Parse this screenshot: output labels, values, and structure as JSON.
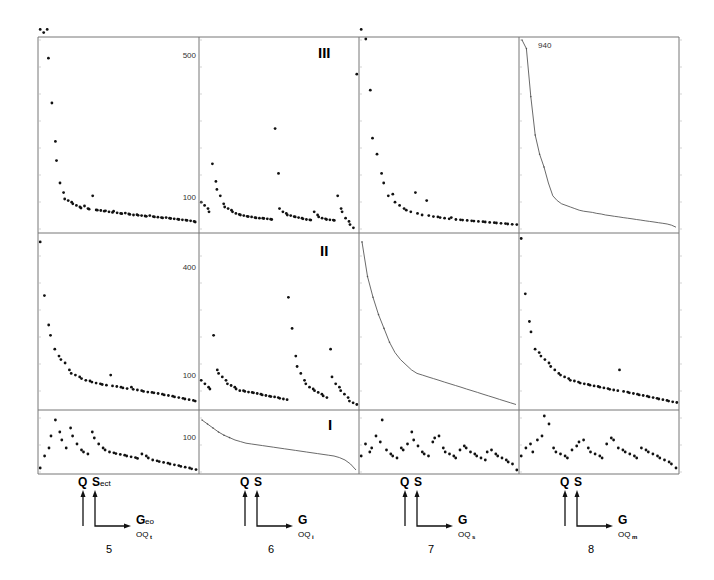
{
  "chart_data": {
    "type": "scatter",
    "title": "",
    "row_labels": [
      "III",
      "II",
      "I"
    ],
    "column_labels": [
      "5",
      "6",
      "7",
      "8"
    ],
    "y_tick_labels": {
      "row_III": [
        "500",
        "100"
      ],
      "row_II": [
        "400",
        "100"
      ],
      "row_I": [
        "100"
      ]
    },
    "annotation": "940",
    "axis_legends": [
      {
        "col": "5",
        "q": "Q",
        "s": "S",
        "s_sub": "ect",
        "g": "G",
        "g_sub": "eo",
        "oq": "OQ",
        "oq_sub": "t"
      },
      {
        "col": "6",
        "q": "Q",
        "s": "S",
        "s_sub": "",
        "g": "G",
        "g_sub": "",
        "oq": "OQ",
        "oq_sub": "i"
      },
      {
        "col": "7",
        "q": "Q",
        "s": "S",
        "s_sub": "",
        "g": "G",
        "g_sub": "",
        "oq": "OQ",
        "oq_sub": "s"
      },
      {
        "col": "8",
        "q": "Q",
        "s": "S",
        "s_sub": "",
        "g": "G",
        "g_sub": "",
        "oq": "OQ",
        "oq_sub": "m"
      }
    ],
    "panels": [
      {
        "row": "III",
        "col": "5",
        "style": "dots",
        "ylim": [
          0,
          600
        ],
        "values": [
          640,
          620,
          650,
          540,
          400,
          280,
          220,
          150,
          120,
          100,
          95,
          90,
          85,
          80,
          75,
          72,
          78,
          70,
          68,
          110,
          66,
          65,
          64,
          62,
          63,
          60,
          58,
          62,
          57,
          55,
          54,
          56,
          53,
          52,
          50,
          51,
          49,
          48,
          47,
          46,
          48,
          45,
          44,
          43,
          42,
          41,
          42,
          40,
          39,
          38,
          37,
          36,
          35,
          34,
          33,
          32,
          30,
          28
        ]
      },
      {
        "row": "III",
        "col": "6",
        "style": "dots",
        "ylim": [
          0,
          600
        ],
        "values": [
          90,
          80,
          70,
          60,
          210,
          155,
          130,
          110,
          85,
          75,
          70,
          65,
          60,
          55,
          52,
          50,
          48,
          46,
          45,
          44,
          42,
          41,
          40,
          40,
          39,
          38,
          37,
          36,
          320,
          180,
          70,
          60,
          55,
          50,
          48,
          45,
          44,
          42,
          40,
          38,
          36,
          35,
          34,
          60,
          50,
          44,
          40,
          38,
          36,
          35,
          34,
          33,
          110,
          70,
          60,
          40,
          30,
          20,
          10,
          490
        ]
      },
      {
        "row": "III",
        "col": "7",
        "style": "dots",
        "ylim": [
          0,
          600
        ],
        "values": [
          630,
          600,
          440,
          290,
          240,
          180,
          150,
          110,
          115,
          90,
          80,
          70,
          65,
          60,
          120,
          55,
          50,
          95,
          48,
          45,
          44,
          42,
          40,
          38,
          42,
          36,
          35,
          34,
          33,
          32,
          31,
          30,
          29,
          28,
          27,
          26,
          25,
          24,
          23,
          22,
          21,
          20
        ]
      },
      {
        "row": "III",
        "col": "8",
        "style": "line",
        "ylim": [
          0,
          600
        ],
        "values": [
          940,
          570,
          420,
          300,
          240,
          200,
          150,
          110,
          95,
          85,
          80,
          75,
          70,
          65,
          62,
          60,
          58,
          55,
          53,
          50,
          48,
          46,
          44,
          42,
          40,
          38,
          36,
          34,
          32,
          30,
          28,
          26,
          24,
          22,
          18,
          12
        ]
      },
      {
        "row": "II",
        "col": "5",
        "style": "dots",
        "ylim": [
          0,
          500
        ],
        "values": [
          480,
          325,
          240,
          210,
          170,
          150,
          140,
          130,
          110,
          100,
          95,
          90,
          85,
          80,
          78,
          75,
          72,
          70,
          68,
          66,
          95,
          64,
          62,
          60,
          58,
          56,
          60,
          54,
          52,
          50,
          48,
          46,
          45,
          44,
          42,
          40,
          38,
          36,
          34,
          32,
          30,
          28,
          26,
          24,
          22,
          20
        ]
      },
      {
        "row": "II",
        "col": "6",
        "style": "dots",
        "ylim": [
          0,
          500
        ],
        "values": [
          80,
          70,
          60,
          55,
          210,
          110,
          100,
          90,
          80,
          70,
          65,
          60,
          55,
          50,
          50,
          48,
          46,
          45,
          44,
          42,
          40,
          38,
          36,
          34,
          33,
          32,
          30,
          28,
          26,
          24,
          320,
          230,
          150,
          120,
          100,
          80,
          70,
          60,
          55,
          50,
          45,
          40,
          35,
          30,
          170,
          90,
          70,
          60,
          50,
          40,
          30,
          20,
          15,
          10
        ]
      },
      {
        "row": "II",
        "col": "7",
        "style": "line",
        "ylim": [
          0,
          500
        ],
        "values": [
          480,
          380,
          320,
          270,
          230,
          190,
          160,
          140,
          125,
          110,
          100,
          95,
          90,
          85,
          80,
          75,
          70,
          65,
          60,
          55,
          50,
          45,
          40,
          35,
          30,
          25,
          20,
          15,
          10
        ]
      },
      {
        "row": "II",
        "col": "8",
        "style": "dots",
        "ylim": [
          0,
          500
        ],
        "values": [
          490,
          330,
          250,
          220,
          170,
          160,
          150,
          140,
          130,
          120,
          110,
          100,
          95,
          90,
          85,
          80,
          78,
          75,
          72,
          70,
          68,
          66,
          64,
          62,
          60,
          58,
          56,
          54,
          52,
          50,
          110,
          48,
          46,
          44,
          42,
          40,
          38,
          36,
          34,
          32,
          30,
          28,
          26,
          24,
          22,
          20,
          18,
          16
        ]
      },
      {
        "row": "I",
        "col": "5",
        "style": "dots",
        "ylim": [
          0,
          150
        ],
        "values": [
          10,
          40,
          60,
          90,
          130,
          100,
          80,
          60,
          110,
          90,
          70,
          55,
          50,
          45,
          100,
          85,
          70,
          60,
          55,
          50,
          48,
          46,
          44,
          42,
          40,
          38,
          36,
          34,
          45,
          40,
          35,
          30,
          28,
          26,
          24,
          22,
          20,
          18,
          16,
          14,
          12,
          10,
          8,
          6
        ]
      },
      {
        "row": "I",
        "col": "6",
        "style": "line",
        "ylim": [
          0,
          150
        ],
        "values": [
          130,
          120,
          110,
          100,
          92,
          86,
          80,
          76,
          72,
          70,
          68,
          66,
          64,
          62,
          60,
          58,
          56,
          54,
          52,
          50,
          48,
          46,
          44,
          42,
          40,
          36,
          30,
          20,
          5
        ]
      },
      {
        "row": "I",
        "col": "7",
        "style": "dots",
        "ylim": [
          0,
          150
        ],
        "values": [
          40,
          70,
          50,
          60,
          90,
          75,
          130,
          55,
          45,
          40,
          35,
          60,
          55,
          70,
          100,
          80,
          65,
          50,
          45,
          40,
          75,
          85,
          90,
          60,
          50,
          45,
          40,
          35,
          55,
          65,
          60,
          50,
          45,
          40,
          35,
          30,
          50,
          55,
          45,
          40,
          35,
          30,
          25,
          20,
          5
        ]
      },
      {
        "row": "I",
        "col": "8",
        "style": "dots",
        "ylim": [
          0,
          150
        ],
        "values": [
          40,
          60,
          70,
          50,
          80,
          90,
          140,
          120,
          60,
          50,
          45,
          40,
          35,
          55,
          65,
          75,
          80,
          60,
          50,
          45,
          40,
          35,
          70,
          85,
          80,
          60,
          55,
          50,
          45,
          40,
          35,
          60,
          55,
          50,
          45,
          40,
          35,
          30,
          25,
          20,
          10
        ]
      }
    ]
  }
}
